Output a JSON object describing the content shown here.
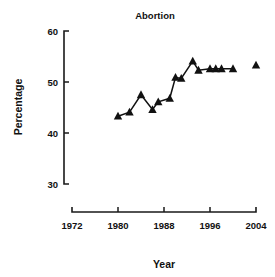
{
  "chart_data": {
    "type": "line",
    "title": "Abortion",
    "xlabel": "Year",
    "ylabel": "Percentage",
    "xlim": [
      1972,
      2004
    ],
    "ylim": [
      30,
      60
    ],
    "grid": false,
    "legend": null,
    "marker": "filled-triangle",
    "xticks": [
      1972,
      1980,
      1988,
      1996,
      2004
    ],
    "xtick_labels": [
      "1972",
      "1980",
      "1988",
      "1996",
      "2004"
    ],
    "yticks": [
      30,
      40,
      50,
      60
    ],
    "ytick_labels": [
      "30",
      "40",
      "50",
      "60"
    ],
    "series": [
      {
        "name": "Abortion",
        "connected": true,
        "x": [
          1980,
          1982,
          1984,
          1986,
          1987,
          1989,
          1990,
          1991,
          1993,
          1994,
          1996,
          1997,
          1998,
          2000
        ],
        "y": [
          43.3,
          44.1,
          47.5,
          44.6,
          46.1,
          46.8,
          50.9,
          50.7,
          54.1,
          52.3,
          52.6,
          52.6,
          52.6,
          52.6
        ]
      },
      {
        "name": "Abortion (isolated point)",
        "connected": false,
        "x": [
          2004
        ],
        "y": [
          53.3
        ]
      }
    ],
    "points": [
      {
        "year": 1980,
        "value": 43.3
      },
      {
        "year": 1981,
        "value": 44.1
      },
      {
        "year": 1983,
        "value": 47.5
      },
      {
        "year": 1985,
        "value": 44.6
      },
      {
        "year": 1987,
        "value": 46.1
      },
      {
        "year": 1989,
        "value": 46.8
      },
      {
        "year": 1991,
        "value": 50.9
      },
      {
        "year": 1993,
        "value": 50.7
      },
      {
        "year": 1995,
        "value": 54.1
      },
      {
        "year": 1997,
        "value": 52.3
      },
      {
        "year": 1999,
        "value": 52.6
      },
      {
        "year": 2004,
        "value": 53.3
      }
    ],
    "colors": {
      "line": "#111111",
      "marker": "#111111",
      "axis": "#1a1a1a",
      "background": "#ffffff"
    }
  }
}
